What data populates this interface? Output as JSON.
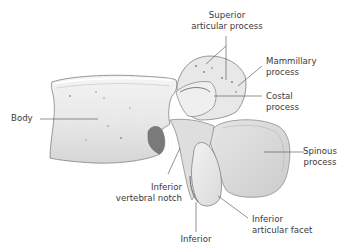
{
  "diagram": {
    "colors": {
      "bone_fill": "#ececec",
      "bone_shade": "#cfcfcf",
      "bone_dark": "#9a9a9a",
      "bone_outline": "#8c8c8c",
      "leader_line": "#4a4a4a",
      "label_text": "#3a3a3a",
      "background": "#ffffff"
    },
    "labels": {
      "superior_articular_process": [
        "Superior",
        "articular process"
      ],
      "mammillary_process": [
        "Mammillary",
        "process"
      ],
      "costal_process": [
        "Costal",
        "process"
      ],
      "body": [
        "Body"
      ],
      "spinous_process": [
        "Spinous",
        "process"
      ],
      "inferior_vertebral_notch": [
        "Inferior",
        "vertebral notch"
      ],
      "inferior_articular_facet": [
        "Inferior",
        "articular facet"
      ],
      "inferior_articular_process": [
        "Inferior"
      ]
    }
  }
}
